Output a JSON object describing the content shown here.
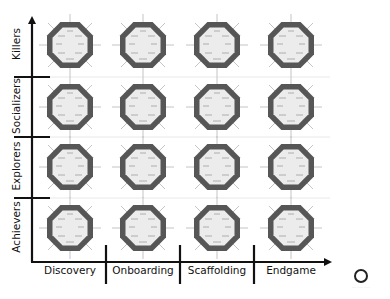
{
  "diagram": {
    "title": "",
    "x_axis": {
      "columns": [
        {
          "label": "Discovery"
        },
        {
          "label": "Onboarding"
        },
        {
          "label": "Scaffolding"
        },
        {
          "label": "Endgame"
        }
      ]
    },
    "y_axis": {
      "rows": [
        {
          "label": "Killers"
        },
        {
          "label": "Socializers"
        },
        {
          "label": "Explorers"
        },
        {
          "label": "Achievers"
        }
      ]
    },
    "cell_glyph": {
      "shape": "octagon-radar",
      "spokes": 8,
      "outer_color": "#555555",
      "inner_color": "#ececec",
      "spoke_color": "#bdbdbd"
    },
    "colors": {
      "axis": "#111111",
      "gridline": "#e6e6e6",
      "background": "#ffffff"
    },
    "logo": {
      "icon": "ring-logo-icon",
      "caption": "···· ······ ······"
    }
  }
}
